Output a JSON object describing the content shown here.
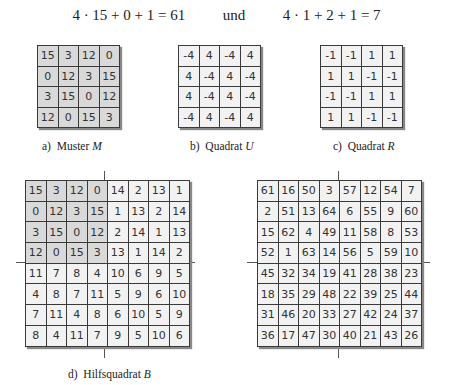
{
  "equation": {
    "left": "4 · 15 + 0 + 1 = 61",
    "connector": "und",
    "right": "4 · 1 + 2 + 1 = 7"
  },
  "figures": {
    "a": {
      "caption_prefix": "a)",
      "caption_text": "Muster ",
      "caption_var": "M",
      "rows": [
        [
          15,
          3,
          12,
          0
        ],
        [
          0,
          12,
          3,
          15
        ],
        [
          3,
          15,
          0,
          12
        ],
        [
          12,
          0,
          15,
          3
        ]
      ],
      "shading": "gray"
    },
    "b": {
      "caption_prefix": "b)",
      "caption_text": "Quadrat ",
      "caption_var": "U",
      "rows": [
        [
          -4,
          4,
          -4,
          4
        ],
        [
          4,
          -4,
          4,
          -4
        ],
        [
          4,
          -4,
          4,
          -4
        ],
        [
          -4,
          4,
          -4,
          4
        ]
      ],
      "shading": "light"
    },
    "c": {
      "caption_prefix": "c)",
      "caption_text": "Quadrat ",
      "caption_var": "R",
      "rows": [
        [
          -1,
          -1,
          1,
          1
        ],
        [
          1,
          1,
          -1,
          -1
        ],
        [
          -1,
          -1,
          1,
          1
        ],
        [
          1,
          1,
          -1,
          -1
        ]
      ],
      "shading": "light"
    },
    "d": {
      "caption_prefix": "d)",
      "caption_text": "Hilfsquadrat ",
      "caption_var": "B",
      "rows": [
        [
          15,
          3,
          12,
          0,
          14,
          2,
          13,
          1
        ],
        [
          0,
          12,
          3,
          15,
          1,
          13,
          2,
          14
        ],
        [
          3,
          15,
          0,
          12,
          2,
          14,
          1,
          13
        ],
        [
          12,
          0,
          15,
          3,
          13,
          1,
          14,
          2
        ],
        [
          11,
          7,
          8,
          4,
          10,
          6,
          9,
          5
        ],
        [
          4,
          8,
          7,
          11,
          5,
          9,
          6,
          10
        ],
        [
          7,
          11,
          4,
          8,
          6,
          10,
          5,
          9
        ],
        [
          8,
          4,
          11,
          7,
          9,
          5,
          10,
          6
        ]
      ],
      "shading": "top-left-quadrant-gray"
    },
    "e": {
      "rows": [
        [
          61,
          16,
          50,
          3,
          57,
          12,
          54,
          7
        ],
        [
          2,
          51,
          13,
          64,
          6,
          55,
          9,
          60
        ],
        [
          15,
          62,
          4,
          49,
          11,
          58,
          8,
          53
        ],
        [
          52,
          1,
          63,
          14,
          56,
          5,
          59,
          10
        ],
        [
          45,
          32,
          34,
          19,
          41,
          28,
          38,
          23
        ],
        [
          18,
          35,
          29,
          48,
          22,
          39,
          25,
          44
        ],
        [
          31,
          46,
          20,
          33,
          27,
          42,
          24,
          37
        ],
        [
          36,
          17,
          47,
          30,
          40,
          21,
          43,
          26
        ]
      ],
      "shading": "light"
    }
  },
  "colors": {
    "gray_cell": "#d9d9d9",
    "light_cell": "#f2f2f2",
    "grid_line": "#3a3a3a"
  }
}
